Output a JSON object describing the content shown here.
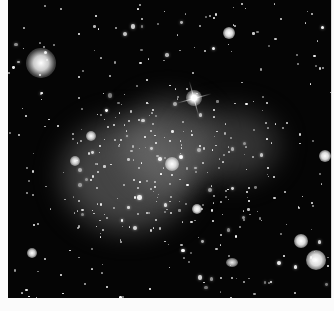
{
  "image": {
    "subject": "deep-field astronomical image of a galaxy cluster with diffuse intracluster glow",
    "background_color": "#050505",
    "haze_color": "#7a7a7a",
    "bright_features": [
      {
        "name": "large-galaxy-top-left",
        "x": 40,
        "y": 62,
        "r": 14
      },
      {
        "name": "bright-star-with-spikes",
        "x": 194,
        "y": 98,
        "r": 6
      },
      {
        "name": "bright-galaxy-center",
        "x": 170,
        "y": 164,
        "r": 6
      },
      {
        "name": "bright-galaxy-right",
        "x": 324,
        "y": 156,
        "r": 5
      },
      {
        "name": "bright-galaxy-bottom-right",
        "x": 316,
        "y": 260,
        "r": 8
      },
      {
        "name": "bright-galaxy-lower-right",
        "x": 300,
        "y": 240,
        "r": 6
      },
      {
        "name": "bright-galaxy-top-center",
        "x": 228,
        "y": 32,
        "r": 5
      },
      {
        "name": "bright-galaxy-lower-center",
        "x": 196,
        "y": 209,
        "r": 4
      }
    ]
  }
}
